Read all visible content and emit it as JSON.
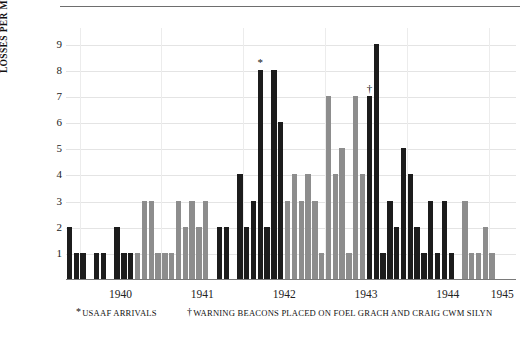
{
  "chart_data": {
    "type": "bar",
    "title": "",
    "xlabel": "",
    "ylabel": "LOSSES PER MONTH",
    "ylim": [
      0,
      9.6
    ],
    "yticks": [
      1,
      2,
      3,
      4,
      5,
      6,
      7,
      8,
      9
    ],
    "ytick_labels": [
      "1",
      "2",
      "3",
      "4",
      "5",
      "6",
      "7",
      "8",
      "9"
    ],
    "grid": true,
    "legend": "none",
    "categories": [
      "1939-11",
      "1939-12",
      "1940-01",
      "1940-02",
      "1940-03",
      "1940-04",
      "1940-05",
      "1940-06",
      "1940-07",
      "1940-08",
      "1940-09",
      "1940-10",
      "1940-11",
      "1940-12",
      "1941-01",
      "1941-02",
      "1941-03",
      "1941-04",
      "1941-05",
      "1941-06",
      "1941-07",
      "1941-08",
      "1941-09",
      "1941-10",
      "1941-11",
      "1941-12",
      "1942-01",
      "1942-02",
      "1942-03",
      "1942-04",
      "1942-05",
      "1942-06",
      "1942-07",
      "1942-08",
      "1942-09",
      "1942-10",
      "1942-11",
      "1942-12",
      "1943-01",
      "1943-02",
      "1943-03",
      "1943-04",
      "1943-05",
      "1943-06",
      "1943-07",
      "1943-08",
      "1943-09",
      "1943-10",
      "1943-11",
      "1943-12",
      "1944-01",
      "1944-02",
      "1944-03",
      "1944-04",
      "1944-05",
      "1944-06",
      "1944-07",
      "1944-08",
      "1944-09",
      "1944-10",
      "1944-11",
      "1944-12",
      "1945-01",
      "1945-02",
      "1945-03",
      "1945-04"
    ],
    "values": [
      2,
      1,
      1,
      0,
      1,
      1,
      0,
      2,
      1,
      1,
      1,
      3,
      3,
      1,
      1,
      1,
      3,
      2,
      3,
      2,
      3,
      0,
      2,
      2,
      0,
      4,
      2,
      3,
      8,
      2,
      8,
      6,
      3,
      4,
      3,
      4,
      3,
      1,
      7,
      4,
      5,
      1,
      7,
      4,
      7,
      9,
      1,
      3,
      2,
      5,
      4,
      2,
      1,
      3,
      1,
      3,
      1,
      0,
      3,
      1,
      1,
      2,
      1,
      0,
      0,
      0
    ],
    "bar_colors": [
      "black",
      "black",
      "black",
      "none",
      "black",
      "black",
      "none",
      "black",
      "black",
      "black",
      "gray",
      "gray",
      "gray",
      "gray",
      "gray",
      "gray",
      "gray",
      "gray",
      "gray",
      "gray",
      "gray",
      "none",
      "black",
      "black",
      "none",
      "black",
      "black",
      "black",
      "black",
      "black",
      "black",
      "black",
      "gray",
      "gray",
      "gray",
      "gray",
      "gray",
      "gray",
      "gray",
      "gray",
      "gray",
      "gray",
      "gray",
      "gray",
      "black",
      "black",
      "black",
      "black",
      "black",
      "black",
      "black",
      "black",
      "black",
      "black",
      "black",
      "black",
      "black",
      "none",
      "gray",
      "gray",
      "gray",
      "gray",
      "gray",
      "none",
      "none",
      "none"
    ],
    "color_map": {
      "black": "#1c1c1c",
      "gray": "#8d8d8d"
    },
    "xtick_labels": [
      "1940",
      "1941",
      "1942",
      "1943",
      "1944",
      "1945"
    ],
    "annotations": [
      {
        "symbol": "*",
        "label": "usaaf-arrivals-marker",
        "bar_index": 28,
        "value": 8
      },
      {
        "symbol": "†",
        "label": "warning-beacons-marker",
        "bar_index": 44,
        "value": 7
      }
    ]
  },
  "footnotes": [
    {
      "mark": "*",
      "text": "USAAF ARRIVALS"
    },
    {
      "mark": "†",
      "text": "WARNING BEACONS PLACED ON FOEL GRACH AND CRAIG CWM SILYN"
    }
  ]
}
